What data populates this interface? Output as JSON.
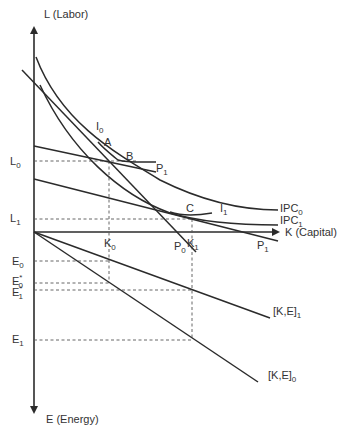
{
  "diagram": {
    "axes": {
      "y_up_label": "L (Labor)",
      "x_right_label": "K (Capital)",
      "y_down_label": "E (Energy)"
    },
    "curve_labels": {
      "I0": {
        "main": "I",
        "sub": "0"
      },
      "I1": {
        "main": "I",
        "sub": "1"
      },
      "IPC0": {
        "main": "IPC",
        "sub": "0"
      },
      "IPC1": {
        "main": "IPC",
        "sub": "1"
      },
      "P0": {
        "main": "P",
        "sub": "0"
      },
      "P1_upper": {
        "main": "P",
        "sub": "1"
      },
      "P1_lower": {
        "main": "P",
        "sub": "1"
      },
      "KE1": {
        "main": "[K,E]",
        "sub": "1"
      },
      "KE0": {
        "main": "[K,E]",
        "sub": "0"
      }
    },
    "points": {
      "A": "A",
      "B": "B",
      "C": "C"
    },
    "ticks": {
      "L0": {
        "main": "L",
        "sub": "0"
      },
      "L1": {
        "main": "L",
        "sub": "1"
      },
      "K0": {
        "main": "K",
        "sub": "0"
      },
      "K1": {
        "main": "K",
        "sub": "1"
      },
      "E0": {
        "main": "E",
        "sub": "0"
      },
      "E0star": {
        "main": "E",
        "sub": "0",
        "sup": "*"
      },
      "E1star": {
        "main": "E",
        "sub": "1",
        "sup": "*"
      },
      "E1": {
        "main": "E",
        "sub": "1"
      }
    },
    "colors": {
      "ink": "#2b2b2b",
      "background": "#ffffff"
    }
  }
}
